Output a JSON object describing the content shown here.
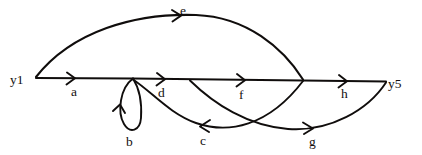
{
  "diagram": {
    "kind": "hand-drawn-directed-multigraph",
    "background_color": "#ffffff",
    "ink_color": "#100d0c",
    "vertices": [
      {
        "id": "y1",
        "label": "y1",
        "x": 24,
        "y": 82
      },
      {
        "id": "y5",
        "label": "y5",
        "x": 390,
        "y": 86
      }
    ],
    "edges": [
      {
        "id": "a",
        "label": "a",
        "label_x": 72,
        "label_y": 95,
        "from": "y1",
        "to": "v2",
        "direction": "right"
      },
      {
        "id": "b",
        "label": "b",
        "label_x": 127,
        "label_y": 143,
        "from": "v2",
        "to": "v2",
        "direction": "loop-up"
      },
      {
        "id": "c",
        "label": "c",
        "label_x": 201,
        "label_y": 142,
        "from": "v4",
        "to": "v2",
        "direction": "left"
      },
      {
        "id": "d",
        "label": "d",
        "label_x": 159,
        "label_y": 96,
        "from": "v2",
        "to": "v3",
        "direction": "right"
      },
      {
        "id": "e",
        "label": "e",
        "label_x": 181,
        "label_y": 14,
        "from": "y1",
        "to": "v4",
        "direction": "right"
      },
      {
        "id": "f",
        "label": "f",
        "label_x": 240,
        "label_y": 98,
        "from": "v3",
        "to": "v4",
        "direction": "right"
      },
      {
        "id": "g",
        "label": "g",
        "label_x": 310,
        "label_y": 143,
        "from": "v3",
        "to": "y5",
        "direction": "right"
      },
      {
        "id": "h",
        "label": "h",
        "label_x": 342,
        "label_y": 97,
        "from": "v4",
        "to": "y5",
        "direction": "right"
      }
    ]
  }
}
